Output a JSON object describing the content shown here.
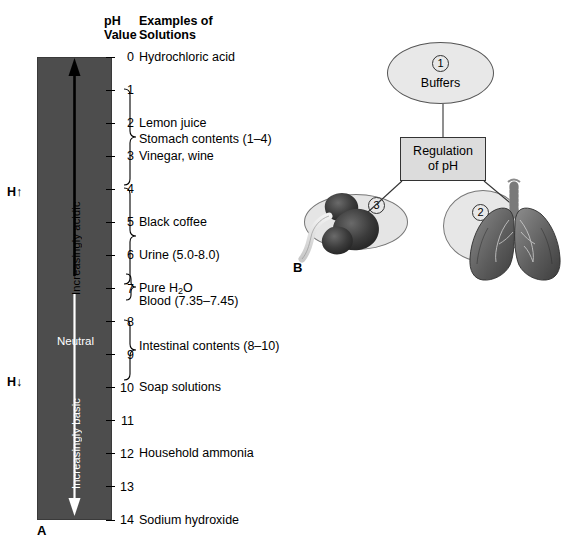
{
  "panel_a": {
    "letter": "A",
    "headers": {
      "ph_value": "pH\nValue",
      "examples": "Examples of\nSolutions"
    },
    "axis": {
      "ticks": [
        0,
        1,
        2,
        3,
        4,
        5,
        6,
        7,
        8,
        9,
        10,
        11,
        12,
        13,
        14
      ],
      "min": 0,
      "max": 14
    },
    "bar_labels": {
      "acidic": "Increasingly acidic",
      "neutral": "Neutral",
      "basic": "Increasingly basic"
    },
    "h_up": "H↑",
    "h_down": "H↓",
    "solutions": [
      {
        "label": "Hydrochloric acid",
        "ph": 0
      },
      {
        "label": "Lemon juice",
        "ph": 2
      },
      {
        "label": "Stomach contents (1–4)",
        "ph": 2.5
      },
      {
        "label": "Vinegar, wine",
        "ph": 3
      },
      {
        "label": "Black coffee",
        "ph": 5
      },
      {
        "label": "Urine (5.0-8.0)",
        "ph": 6
      },
      {
        "label": "Pure H2O",
        "ph": 7
      },
      {
        "label": "Blood (7.35–7.45)",
        "ph": 7.4
      },
      {
        "label": "Intestinal contents (8–10)",
        "ph": 8.75
      },
      {
        "label": "Soap solutions",
        "ph": 10
      },
      {
        "label": "Household ammonia",
        "ph": 12
      },
      {
        "label": "Sodium hydroxide",
        "ph": 14
      }
    ],
    "brackets": [
      {
        "from": 1,
        "to": 4,
        "name": "stomach-contents-bracket"
      },
      {
        "from": 5,
        "to": 8,
        "name": "urine-bracket"
      },
      {
        "from": 7,
        "to": 7.8,
        "name": "blood-bracket"
      },
      {
        "from": 8,
        "to": 10,
        "name": "intestinal-contents-bracket"
      }
    ]
  },
  "panel_b": {
    "letter": "B",
    "buffers": {
      "label": "Buffers",
      "number": "1"
    },
    "regulation": {
      "label": "Regulation\nof pH"
    },
    "lungs": {
      "number": "2"
    },
    "kidneys": {
      "number": "3"
    }
  },
  "colors": {
    "bar_fill": "#4d4d4d",
    "box_fill": "#dcdcdc",
    "ellipse_fill": "#e8e8e8",
    "text": "#000000"
  }
}
